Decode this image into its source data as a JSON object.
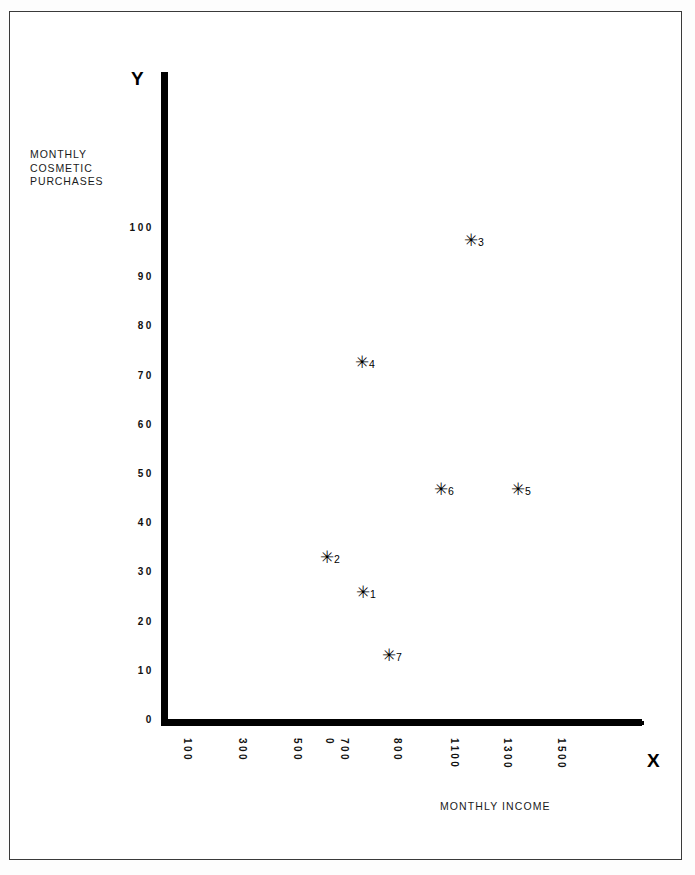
{
  "figure": {
    "y_axis_letter": "Y",
    "x_axis_letter": "X",
    "y_axis_title": "MONTHLY\nCOSMETIC\nPURCHASES",
    "x_axis_title": "MONTHLY INCOME"
  },
  "chart_data": {
    "type": "scatter",
    "title": "",
    "xlabel": "MONTHLY INCOME",
    "ylabel": "MONTHLY COSMETIC PURCHASES",
    "xlim": [
      0,
      1600
    ],
    "ylim": [
      0,
      105
    ],
    "grid": false,
    "legend": "none",
    "marker": "asterisk",
    "x_tick_labels": [
      "100",
      "300",
      "500",
      "0",
      "700",
      "800",
      "1100",
      "1300",
      "1500"
    ],
    "y_tick_labels": [
      "0",
      "10",
      "20",
      "30",
      "40",
      "50",
      "60",
      "70",
      "80",
      "90",
      "100"
    ],
    "y_ticks": [
      0,
      10,
      20,
      30,
      40,
      50,
      60,
      70,
      80,
      90,
      100
    ],
    "points": [
      {
        "label": "1",
        "x": 800,
        "y": 24
      },
      {
        "label": "2",
        "x": 620,
        "y": 37
      },
      {
        "label": "3",
        "x": 1250,
        "y": 94
      },
      {
        "label": "4",
        "x": 740,
        "y": 70
      },
      {
        "label": "5",
        "x": 1500,
        "y": 44
      },
      {
        "label": "6",
        "x": 1110,
        "y": 44
      },
      {
        "label": "7",
        "x": 880,
        "y": 12
      }
    ]
  }
}
